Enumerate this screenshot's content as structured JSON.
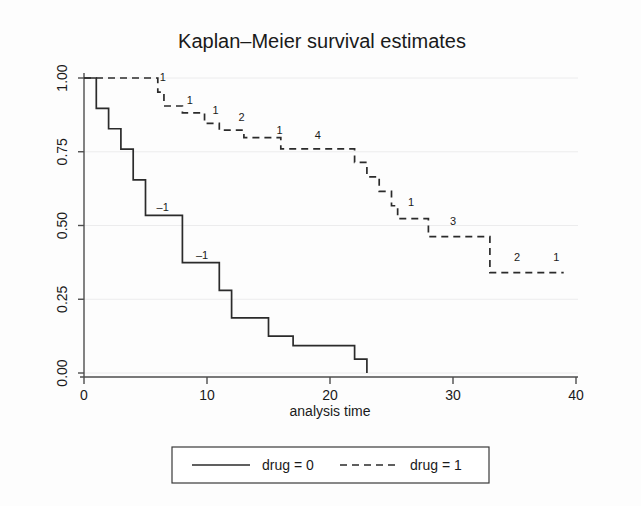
{
  "chart_data": {
    "type": "line",
    "subtype": "kaplan-meier-step",
    "title": "Kaplan–Meier survival estimates",
    "xlabel": "analysis time",
    "ylabel": "",
    "xlim": [
      0,
      40
    ],
    "ylim": [
      0.0,
      1.0
    ],
    "xticks": [
      0,
      10,
      20,
      30,
      40
    ],
    "xtick_labels": [
      "0",
      "10",
      "20",
      "30",
      "40"
    ],
    "yticks": [
      0.0,
      0.25,
      0.5,
      0.75,
      1.0
    ],
    "ytick_labels": [
      "0.00",
      "0.25",
      "0.50",
      "0.75",
      "1.00"
    ],
    "grid": "horizontal",
    "legend_position": "bottom-outside",
    "series": [
      {
        "name": "drug = 0",
        "style": "solid",
        "color": "#2b2b2b",
        "steps": [
          {
            "t": 0,
            "s": 1.0
          },
          {
            "t": 1,
            "s": 1.0
          },
          {
            "t": 1,
            "s": 0.897
          },
          {
            "t": 2,
            "s": 0.897
          },
          {
            "t": 2,
            "s": 0.828
          },
          {
            "t": 3,
            "s": 0.828
          },
          {
            "t": 3,
            "s": 0.759
          },
          {
            "t": 4,
            "s": 0.759
          },
          {
            "t": 4,
            "s": 0.655
          },
          {
            "t": 5,
            "s": 0.655
          },
          {
            "t": 5,
            "s": 0.534
          },
          {
            "t": 8,
            "s": 0.534
          },
          {
            "t": 8,
            "s": 0.374
          },
          {
            "t": 11,
            "s": 0.374
          },
          {
            "t": 11,
            "s": 0.28
          },
          {
            "t": 12,
            "s": 0.28
          },
          {
            "t": 12,
            "s": 0.187
          },
          {
            "t": 15,
            "s": 0.187
          },
          {
            "t": 15,
            "s": 0.125
          },
          {
            "t": 17,
            "s": 0.125
          },
          {
            "t": 17,
            "s": 0.093
          },
          {
            "t": 22,
            "s": 0.093
          },
          {
            "t": 22,
            "s": 0.047
          },
          {
            "t": 23,
            "s": 0.047
          },
          {
            "t": 23,
            "s": 0.0
          }
        ],
        "censor_labels": [
          {
            "t": 6.4,
            "s": 0.534,
            "text": "–1"
          },
          {
            "t": 9.6,
            "s": 0.374,
            "text": "–1"
          }
        ]
      },
      {
        "name": "drug = 1",
        "style": "dashed",
        "color": "#2b2b2b",
        "steps": [
          {
            "t": 0,
            "s": 1.0
          },
          {
            "t": 6,
            "s": 1.0
          },
          {
            "t": 6,
            "s": 0.952
          },
          {
            "t": 6.5,
            "s": 0.952
          },
          {
            "t": 6.5,
            "s": 0.905
          },
          {
            "t": 8,
            "s": 0.905
          },
          {
            "t": 8,
            "s": 0.882
          },
          {
            "t": 9.8,
            "s": 0.882
          },
          {
            "t": 9.8,
            "s": 0.846
          },
          {
            "t": 11,
            "s": 0.846
          },
          {
            "t": 11,
            "s": 0.823
          },
          {
            "t": 13,
            "s": 0.823
          },
          {
            "t": 13,
            "s": 0.798
          },
          {
            "t": 16,
            "s": 0.798
          },
          {
            "t": 16,
            "s": 0.76
          },
          {
            "t": 22,
            "s": 0.76
          },
          {
            "t": 22,
            "s": 0.714
          },
          {
            "t": 23,
            "s": 0.714
          },
          {
            "t": 23,
            "s": 0.665
          },
          {
            "t": 24,
            "s": 0.665
          },
          {
            "t": 24,
            "s": 0.616
          },
          {
            "t": 25,
            "s": 0.616
          },
          {
            "t": 25,
            "s": 0.567
          },
          {
            "t": 25.5,
            "s": 0.567
          },
          {
            "t": 25.5,
            "s": 0.523
          },
          {
            "t": 28,
            "s": 0.523
          },
          {
            "t": 28,
            "s": 0.462
          },
          {
            "t": 33,
            "s": 0.462
          },
          {
            "t": 33,
            "s": 0.34
          },
          {
            "t": 39,
            "s": 0.34
          }
        ],
        "censor_labels": [
          {
            "t": 6.4,
            "s": 0.975,
            "text": "1"
          },
          {
            "t": 8.6,
            "s": 0.9,
            "text": "1"
          },
          {
            "t": 10.7,
            "s": 0.866,
            "text": "1"
          },
          {
            "t": 12.8,
            "s": 0.841,
            "text": "2"
          },
          {
            "t": 15.9,
            "s": 0.795,
            "text": "1"
          },
          {
            "t": 19.0,
            "s": 0.78,
            "text": "4"
          },
          {
            "t": 26.6,
            "s": 0.552,
            "text": "1"
          },
          {
            "t": 30.0,
            "s": 0.488,
            "text": "3"
          },
          {
            "t": 35.2,
            "s": 0.366,
            "text": "2"
          },
          {
            "t": 38.4,
            "s": 0.366,
            "text": "1"
          }
        ]
      }
    ],
    "legend_entries": [
      {
        "label": "drug = 0",
        "style": "solid"
      },
      {
        "label": "drug = 1",
        "style": "dashed"
      }
    ]
  }
}
